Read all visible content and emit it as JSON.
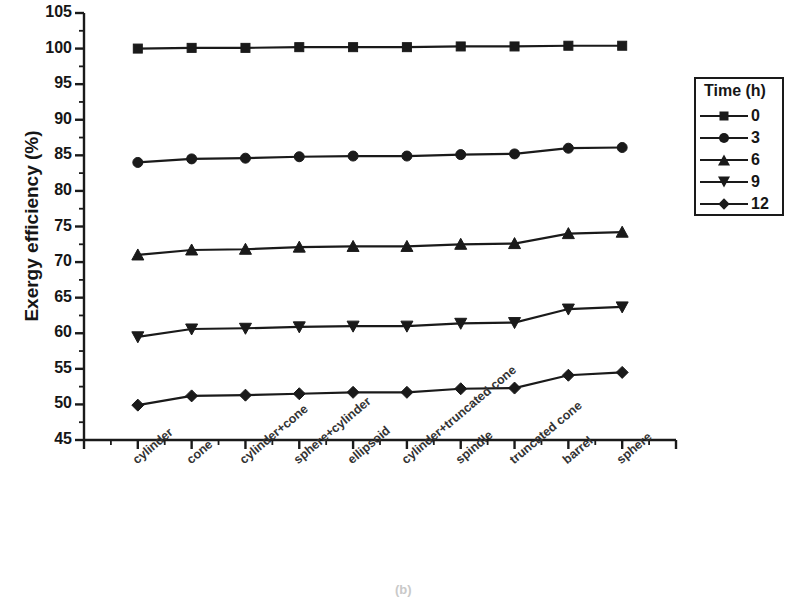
{
  "chart_data": {
    "type": "line",
    "title": "",
    "xlabel": "",
    "ylabel": "Exergy efficiency (%)",
    "ylim": [
      45,
      105
    ],
    "ytick_labels": [
      "45",
      "50",
      "55",
      "60",
      "65",
      "70",
      "75",
      "80",
      "85",
      "90",
      "95",
      "100",
      "105"
    ],
    "ytick_values": [
      45,
      50,
      55,
      60,
      65,
      70,
      75,
      80,
      85,
      90,
      95,
      100,
      105
    ],
    "minor_tick_step": 2.5,
    "grid": false,
    "legend_position": "right-outside",
    "legend_title": "Time (h)",
    "categories": [
      "cylinder",
      "cone",
      "cylinder+cone",
      "sphere+cylinder",
      "ellipsoid",
      "cylinder+truncated cone",
      "spindle",
      "truncated cone",
      "barrel",
      "sphere"
    ],
    "series": [
      {
        "name": "0",
        "marker": "square",
        "values": [
          100.0,
          100.1,
          100.1,
          100.2,
          100.2,
          100.2,
          100.3,
          100.3,
          100.4,
          100.4
        ]
      },
      {
        "name": "3",
        "marker": "circle",
        "values": [
          84.0,
          84.5,
          84.6,
          84.8,
          84.9,
          84.9,
          85.1,
          85.2,
          86.0,
          86.1
        ]
      },
      {
        "name": "6",
        "marker": "triangle-up",
        "values": [
          71.0,
          71.7,
          71.8,
          72.1,
          72.2,
          72.2,
          72.5,
          72.6,
          74.0,
          74.2
        ]
      },
      {
        "name": "9",
        "marker": "triangle-down",
        "values": [
          59.5,
          60.6,
          60.7,
          60.9,
          61.0,
          61.0,
          61.4,
          61.5,
          63.4,
          63.7
        ]
      },
      {
        "name": "12",
        "marker": "diamond",
        "values": [
          49.9,
          51.2,
          51.3,
          51.5,
          51.7,
          51.7,
          52.2,
          52.3,
          54.1,
          54.5
        ]
      }
    ]
  },
  "legend": {
    "title": "Time (h)",
    "entries": [
      {
        "label": "0",
        "marker": "square"
      },
      {
        "label": "3",
        "marker": "circle"
      },
      {
        "label": "6",
        "marker": "triangle-up"
      },
      {
        "label": "9",
        "marker": "triangle-down"
      },
      {
        "label": "12",
        "marker": "diamond"
      }
    ]
  },
  "panel_label": "(b)",
  "colors": {
    "line": "#1a1a1a",
    "marker": "#1a1a1a",
    "axis": "#1a1a1a",
    "text": "#161616",
    "background": "#ffffff"
  }
}
